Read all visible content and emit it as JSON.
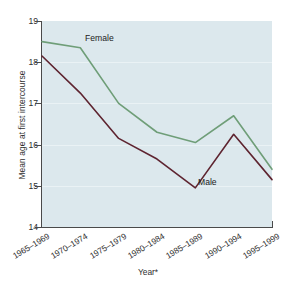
{
  "chart_data": {
    "type": "line",
    "title": "",
    "xlabel": "Year*",
    "ylabel": "Mean age at first intercourse",
    "categories": [
      "1965–1969",
      "1970–1974",
      "1975–1979",
      "1980–1984",
      "1985–1989",
      "1990–1994",
      "1995–1999"
    ],
    "ylim": [
      14,
      19
    ],
    "yticks": [
      14,
      15,
      16,
      17,
      18,
      19
    ],
    "grid": "faint-horizontal",
    "legend_position": "inline-labels",
    "series": [
      {
        "name": "Female",
        "color": "#6f9e78",
        "values": [
          18.5,
          18.35,
          17.0,
          16.3,
          16.05,
          16.7,
          15.4
        ]
      },
      {
        "name": "Male",
        "color": "#5e2430",
        "values": [
          18.15,
          17.25,
          16.15,
          15.65,
          14.95,
          16.25,
          15.15
        ]
      }
    ]
  },
  "style": {
    "plot_background": "#dce8ed",
    "axis_color": "#4a4a4a",
    "text_color": "#2e2e2e"
  },
  "annotations": {
    "female_label": "Female",
    "male_label": "Male"
  }
}
